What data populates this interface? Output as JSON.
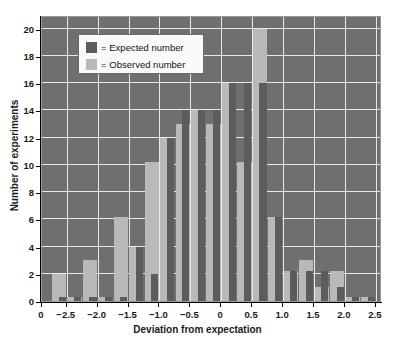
{
  "chart_data": {
    "type": "bar",
    "title": "",
    "xlabel": "Deviation from expectation",
    "ylabel": "Number of experiments",
    "xlim": [
      -2.9,
      2.6
    ],
    "ylim": [
      0,
      21
    ],
    "grid": true,
    "legend_position": "top-left",
    "xtick_labels": [
      "0",
      "−2.5",
      "−2.0",
      "−1.5",
      "−1.0",
      "−0.5",
      "0",
      "0.5",
      "1.0",
      "1.5",
      "2.0",
      "2.5"
    ],
    "xtick_values": [
      -2.9,
      -2.5,
      -2.0,
      -1.5,
      -1.0,
      -0.5,
      0,
      0.5,
      1.0,
      1.5,
      2.0,
      2.5
    ],
    "ytick_labels": [
      "0",
      "2",
      "4",
      "6",
      "8",
      "10",
      "12",
      "14",
      "16",
      "18",
      "20"
    ],
    "ytick_values": [
      0,
      2,
      4,
      6,
      8,
      10,
      12,
      14,
      16,
      18,
      20
    ],
    "bin_width": 0.25,
    "x": [
      -2.625,
      -2.375,
      -2.125,
      -1.875,
      -1.625,
      -1.375,
      -1.125,
      -0.875,
      -0.625,
      -0.375,
      -0.125,
      0.125,
      0.375,
      0.625,
      0.875,
      1.125,
      1.375,
      1.625,
      1.875,
      2.125,
      2.375
    ],
    "series": [
      {
        "name": "Expected number",
        "color": "#5c5c5c",
        "values": [
          0.3,
          0.3,
          0.3,
          0.3,
          0.3,
          4,
          2,
          12,
          14,
          14,
          14,
          16,
          16,
          16,
          6.2,
          2.2,
          2.2,
          2.2,
          1,
          0.3,
          0.3
        ]
      },
      {
        "name": "Observed number",
        "color": "#b9b9b9",
        "values": [
          2,
          0.3,
          3,
          0.3,
          6.2,
          4,
          10.2,
          12,
          13,
          14,
          13,
          16,
          10.2,
          20,
          6.2,
          2.2,
          3,
          1,
          2.2,
          0.3,
          0.3
        ]
      }
    ]
  },
  "legend": {
    "equals": "=",
    "items": [
      {
        "label": "Expected number",
        "swatch": "expected-swatch"
      },
      {
        "label": "Observed number",
        "swatch": "observed-swatch"
      }
    ]
  },
  "axes": {
    "x_title": "Deviation from expectation",
    "y_title": "Number of experiments"
  }
}
